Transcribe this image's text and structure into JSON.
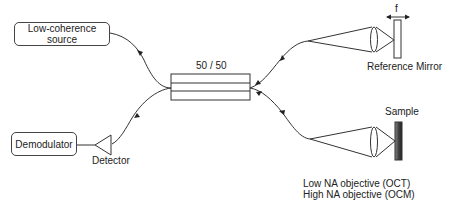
{
  "diagram": {
    "nodes": {
      "source": {
        "label_line1": "Low-coherence",
        "label_line2": "source"
      },
      "coupler": {
        "label": "50 / 50"
      },
      "demodulator": {
        "label": "Demodulator"
      },
      "detector": {
        "label": "Detector"
      },
      "reference_mirror": {
        "label": "Reference Mirror",
        "scan_label": "f"
      },
      "sample": {
        "label": "Sample"
      }
    },
    "notes": {
      "line1": "Low NA objective (OCT)",
      "line2": "High NA objective (OCM)"
    },
    "edges": [
      {
        "from": "source",
        "to": "coupler",
        "type": "fiber"
      },
      {
        "from": "coupler",
        "to": "detector",
        "type": "fiber"
      },
      {
        "from": "detector",
        "to": "demodulator",
        "type": "wire"
      },
      {
        "from": "coupler",
        "to": "reference_mirror",
        "type": "fiber+lens"
      },
      {
        "from": "coupler",
        "to": "sample",
        "type": "fiber+lens"
      }
    ],
    "colors": {
      "stroke": "#333333",
      "sample_fill": "#555555"
    }
  }
}
